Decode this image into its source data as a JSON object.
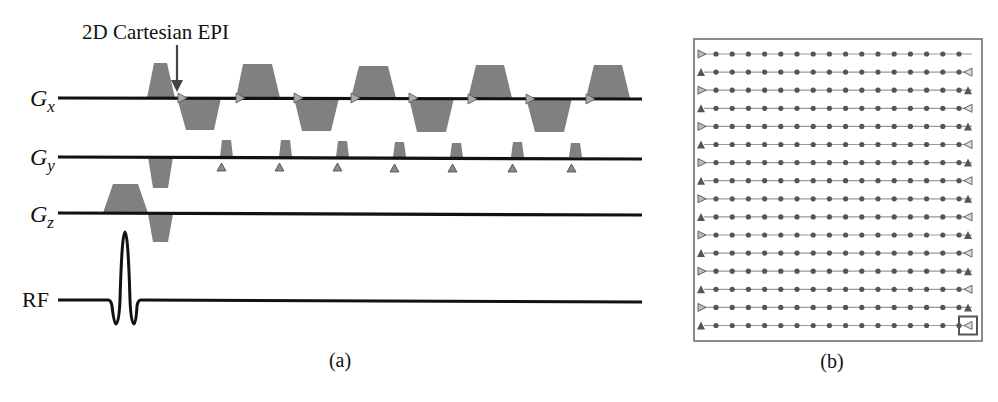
{
  "panel_a": {
    "annotation": "2D Cartesian EPI",
    "caption": "(a)",
    "channels": [
      {
        "id": "gx",
        "label": "G",
        "sub": "x"
      },
      {
        "id": "gy",
        "label": "G",
        "sub": "y"
      },
      {
        "id": "gz",
        "label": "G",
        "sub": "z"
      },
      {
        "id": "rf",
        "label": "RF",
        "sub": ""
      }
    ],
    "readout_lobes": 9,
    "phase_blips": 7
  },
  "panel_b": {
    "caption": "(b)",
    "title": "k-space trajectory",
    "rows": 16,
    "samples_per_row": 16
  },
  "colors": {
    "axis": "#111111",
    "gradient_fill": "#808080",
    "marker_fill": "#8a8a8a",
    "kspace_line": "#9a9a9a",
    "kspace_dot": "#555555",
    "frame": "#666666"
  }
}
